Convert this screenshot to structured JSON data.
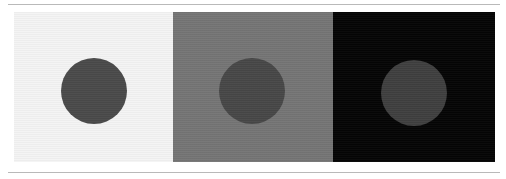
{
  "figure": {
    "width": 506,
    "height": 179,
    "background_color": "#ffffff",
    "rules": {
      "color": "#b9b9b9",
      "top_y": 4,
      "bottom_y": 172,
      "thickness": 1,
      "left": 8,
      "width": 492
    },
    "strip": {
      "left": 14,
      "top": 12,
      "width": 481,
      "height": 150
    },
    "panels": [
      {
        "id": "panel-light",
        "label": "",
        "background_color": "#f4f4f4",
        "width": 159,
        "disc": {
          "color": "#4a4a4a",
          "diameter": 66,
          "center_x": 80,
          "center_y": 79
        }
      },
      {
        "id": "panel-mid-gray",
        "label": "",
        "background_color": "#757575",
        "width": 160,
        "disc": {
          "color": "#474747",
          "diameter": 66,
          "center_x": 79,
          "center_y": 79
        }
      },
      {
        "id": "panel-black",
        "label": "",
        "background_color": "#050505",
        "width": 162,
        "disc": {
          "color": "#3f3f3f",
          "diameter": 66,
          "center_x": 81,
          "center_y": 81
        }
      }
    ]
  }
}
